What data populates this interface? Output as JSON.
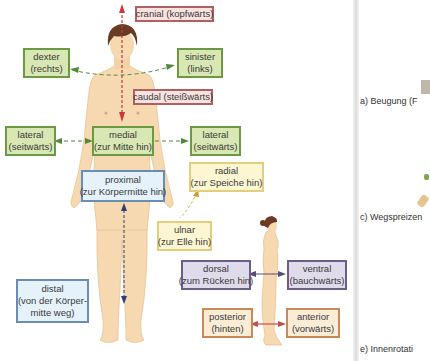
{
  "figure": {
    "front_view": {
      "labels": {
        "cranial": {
          "term": "cranial (kopfwärts)"
        },
        "caudal": {
          "term": "caudal (steißwärts)"
        },
        "dexter": {
          "term": "dexter",
          "meaning": "(rechts)"
        },
        "sinister": {
          "term": "sinister",
          "meaning": "(links)"
        },
        "lateral_left": {
          "term": "lateral",
          "meaning": "(seitwärts)"
        },
        "medial": {
          "term": "medial",
          "meaning": "(zur Mitte hin)"
        },
        "lateral_right": {
          "term": "lateral",
          "meaning": "(seitwärts)"
        },
        "proximal": {
          "term": "proximal",
          "meaning": "(zur Körpermitte hin)"
        },
        "radial": {
          "term": "radial",
          "meaning": "(zur Speiche hin)"
        },
        "ulnar": {
          "term": "ulnar",
          "meaning": "(zur Elle hin)"
        },
        "distal": {
          "term": "distal",
          "line2": "(von der Körper-",
          "line3": "mitte weg)"
        }
      }
    },
    "side_view": {
      "labels": {
        "dorsal": {
          "term": "dorsal",
          "meaning": "(zum Rücken hin)"
        },
        "ventral": {
          "term": "ventral",
          "meaning": "(bauchwärts)"
        },
        "posterior": {
          "term": "posterior",
          "meaning": "(hinten)"
        },
        "anterior": {
          "term": "anterior",
          "meaning": "(vorwärts)"
        }
      }
    },
    "colors": {
      "red_box": "#f9e3e0",
      "green_box": "#d9e7b4",
      "blue_box": "#e6f2fa",
      "yellow_box": "#fdf6d2",
      "purple_box": "#e0dbea",
      "orange_box": "#fbecd6",
      "skin": "#f6d9b0",
      "hair": "#6b3a22"
    }
  },
  "right_page": {
    "captions": [
      "a) Beugung (F",
      "c) Wegspreizen",
      "e) Innenrotati"
    ]
  }
}
